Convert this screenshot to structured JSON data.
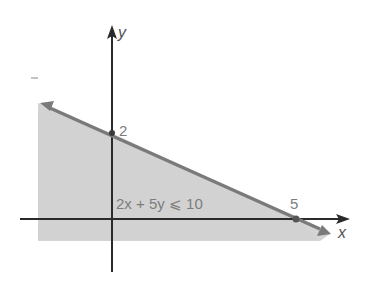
{
  "figure": {
    "type": "linear-inequality-graph",
    "inequality_label": "2x + 5y ⩽ 10",
    "x_axis_label": "x",
    "y_axis_label": "y",
    "y_intercept_label": "2",
    "x_intercept_label": "5",
    "boundary_line": {
      "equation": "2x + 5y = 10",
      "y_intercept": 2,
      "x_intercept": 5
    },
    "shaded_region": "below boundary line",
    "colors": {
      "shading": "#d4d4d4",
      "boundary_line": "#7a7a7a",
      "axes": "#2a2a2a",
      "label_text": "#7d7d7d"
    }
  }
}
